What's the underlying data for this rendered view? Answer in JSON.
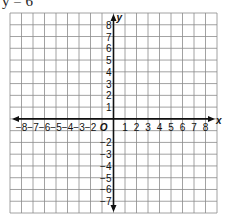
{
  "title": "y = 6",
  "chart_data": {
    "type": "coordinate-grid",
    "title": "y = 6",
    "xlabel": "x",
    "ylabel": "y",
    "origin_label": "O",
    "x_ticks": [
      -8,
      -7,
      -6,
      -5,
      -4,
      -3,
      -2,
      1,
      2,
      3,
      4,
      5,
      6,
      7,
      8
    ],
    "y_ticks": [
      8,
      7,
      6,
      5,
      4,
      3,
      2,
      1,
      -2,
      -3,
      -4,
      -5,
      -6,
      -7
    ],
    "xlim": [
      -9,
      9
    ],
    "ylim": [
      -8,
      9
    ],
    "grid": true,
    "series": []
  },
  "labels": {
    "x_axis": "x",
    "y_axis": "y",
    "origin": "O"
  }
}
